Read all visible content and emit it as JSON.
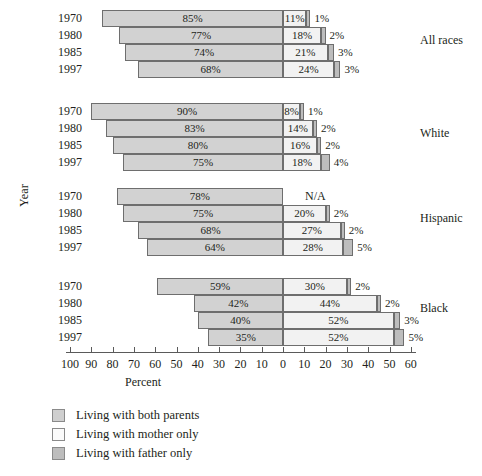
{
  "chart_data": {
    "type": "bar",
    "orientation": "horizontal",
    "subtype": "diverging-stacked",
    "title": "",
    "xlabel": "Percent",
    "ylabel": "Year",
    "xlim": [
      -100,
      60
    ],
    "zero_at": 0,
    "grid": false,
    "legend_position": "bottom-left",
    "legend": [
      {
        "label": "Living with both parents",
        "key": "both_parents",
        "color": "#d2d2d2",
        "side": "left"
      },
      {
        "label": "Living with mother only",
        "key": "mother_only",
        "color": "#f2f2f2",
        "side": "right"
      },
      {
        "label": "Living with father only",
        "key": "father_only",
        "color": "#bdbdbd",
        "side": "right"
      }
    ],
    "xticks": [
      100,
      90,
      80,
      70,
      60,
      50,
      40,
      30,
      20,
      10,
      0,
      10,
      20,
      30,
      40,
      50,
      60
    ],
    "categories": [
      "1970",
      "1980",
      "1985",
      "1997"
    ],
    "groups": [
      {
        "name": "All races",
        "rows": [
          {
            "year": "1970",
            "both_parents": 85,
            "mother_only": 11,
            "father_only": 1,
            "both_label": "85%",
            "mother_label": "11%",
            "father_label": "1%"
          },
          {
            "year": "1980",
            "both_parents": 77,
            "mother_only": 18,
            "father_only": 2,
            "both_label": "77%",
            "mother_label": "18%",
            "father_label": "2%"
          },
          {
            "year": "1985",
            "both_parents": 74,
            "mother_only": 21,
            "father_only": 3,
            "both_label": "74%",
            "mother_label": "21%",
            "father_label": "3%"
          },
          {
            "year": "1997",
            "both_parents": 68,
            "mother_only": 24,
            "father_only": 3,
            "both_label": "68%",
            "mother_label": "24%",
            "father_label": "3%"
          }
        ]
      },
      {
        "name": "White",
        "rows": [
          {
            "year": "1970",
            "both_parents": 90,
            "mother_only": 8,
            "father_only": 1,
            "both_label": "90%",
            "mother_label": "8%",
            "father_label": "1%"
          },
          {
            "year": "1980",
            "both_parents": 83,
            "mother_only": 14,
            "father_only": 2,
            "both_label": "83%",
            "mother_label": "14%",
            "father_label": "2%"
          },
          {
            "year": "1985",
            "both_parents": 80,
            "mother_only": 16,
            "father_only": 2,
            "both_label": "80%",
            "mother_label": "16%",
            "father_label": "2%"
          },
          {
            "year": "1997",
            "both_parents": 75,
            "mother_only": 18,
            "father_only": 4,
            "both_label": "75%",
            "mother_label": "18%",
            "father_label": "4%"
          }
        ]
      },
      {
        "name": "Hispanic",
        "rows": [
          {
            "year": "1970",
            "both_parents": 78,
            "mother_only": null,
            "father_only": null,
            "both_label": "78%",
            "mother_label": "N/A",
            "father_label": ""
          },
          {
            "year": "1980",
            "both_parents": 75,
            "mother_only": 20,
            "father_only": 2,
            "both_label": "75%",
            "mother_label": "20%",
            "father_label": "2%"
          },
          {
            "year": "1985",
            "both_parents": 68,
            "mother_only": 27,
            "father_only": 2,
            "both_label": "68%",
            "mother_label": "27%",
            "father_label": "2%"
          },
          {
            "year": "1997",
            "both_parents": 64,
            "mother_only": 28,
            "father_only": 5,
            "both_label": "64%",
            "mother_label": "28%",
            "father_label": "5%"
          }
        ]
      },
      {
        "name": "Black",
        "rows": [
          {
            "year": "1970",
            "both_parents": 59,
            "mother_only": 30,
            "father_only": 2,
            "both_label": "59%",
            "mother_label": "30%",
            "father_label": "2%"
          },
          {
            "year": "1980",
            "both_parents": 42,
            "mother_only": 44,
            "father_only": 2,
            "both_label": "42%",
            "mother_label": "44%",
            "father_label": "2%"
          },
          {
            "year": "1985",
            "both_parents": 40,
            "mother_only": 52,
            "father_only": 3,
            "both_label": "40%",
            "mother_label": "52%",
            "father_label": "3%"
          },
          {
            "year": "1997",
            "both_parents": 35,
            "mother_only": 52,
            "father_only": 5,
            "both_label": "35%",
            "mother_label": "52%",
            "father_label": "5%"
          }
        ]
      }
    ]
  }
}
